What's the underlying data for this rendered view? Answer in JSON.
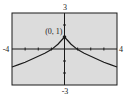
{
  "chart_data": {
    "type": "line",
    "title": "",
    "xlabel": "",
    "ylabel": "",
    "xlim": [
      -4,
      4
    ],
    "ylim": [
      -3,
      3
    ],
    "grid": false,
    "xtick_labels": {
      "min": "-4",
      "max": "4"
    },
    "ytick_labels": {
      "min": "-3",
      "max": "3"
    },
    "xticks": [
      -3,
      -2,
      -1,
      1,
      2,
      3
    ],
    "yticks": [
      -2,
      -1,
      1,
      2
    ],
    "series": [
      {
        "name": "curve",
        "x": [
          -4,
          -3.5,
          -3,
          -2.5,
          -2,
          -1.5,
          -1,
          -0.5,
          0,
          0.5,
          1,
          1.5,
          2,
          2.5,
          3,
          3.5,
          4
        ],
        "y": [
          -1.5,
          -1.3,
          -1.1,
          -0.85,
          -0.6,
          -0.35,
          -0.05,
          0.4,
          1,
          0.4,
          -0.05,
          -0.35,
          -0.6,
          -0.85,
          -1.1,
          -1.3,
          -1.5
        ]
      }
    ],
    "annotations": [
      {
        "text": "(0, 1)",
        "x": 0,
        "y": 1,
        "marker": true
      }
    ]
  },
  "colors": {
    "plot_background": "#dcdcdc",
    "frame": "#1a1a1a",
    "axis": "#1a1a1a",
    "curve": "#1a1a1a"
  }
}
